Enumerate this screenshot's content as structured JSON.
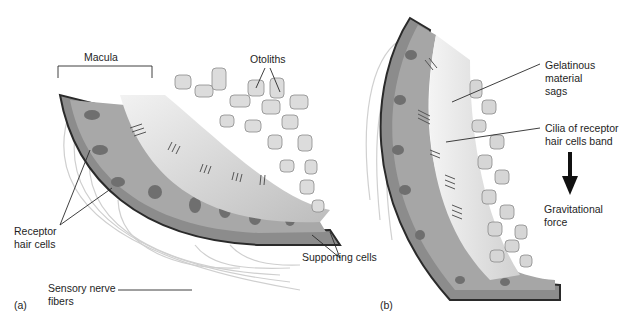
{
  "figure": {
    "panel_a": {
      "panel_label": "(a)",
      "labels": {
        "macula": "Macula",
        "otoliths": "Otoliths",
        "receptor_hair_cells": "Receptor\nhair cells",
        "sensory_nerve_fibers": "Sensory nerve\nfibers",
        "supporting_cells": "Supporting cells"
      }
    },
    "panel_b": {
      "panel_label": "(b)",
      "labels": {
        "gelatinous_material": "Gelatinous\nmaterial\nsags",
        "cilia_band": "Cilia of receptor\nhair cells band",
        "gravitational_force": "Gravitational\nforce"
      }
    },
    "colors": {
      "tissue_dark": "#5a5a5a",
      "tissue_mid": "#9a9a9a",
      "tissue_light": "#cfcfcf",
      "gel": "#e6e6e6",
      "otolith": "#d8d8d8",
      "leader_line": "#2a2a2a"
    }
  }
}
